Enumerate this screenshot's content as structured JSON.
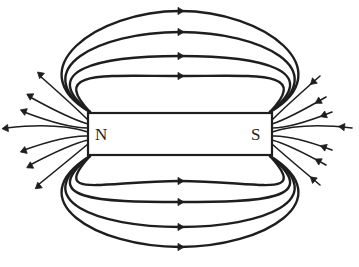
{
  "diagram": {
    "magnet": {
      "north_label": "N",
      "south_label": "S"
    },
    "field_loops": {
      "above_count": 4,
      "below_count": 4,
      "arrow_direction": "north-to-south"
    },
    "end_fans": {
      "north_side_count": 7,
      "south_side_count": 7,
      "north_arrows": "pointing away from N",
      "south_arrows": "pointing toward S"
    },
    "colors": {
      "ink": "#1e1e1e",
      "background": "#ffffff"
    }
  }
}
